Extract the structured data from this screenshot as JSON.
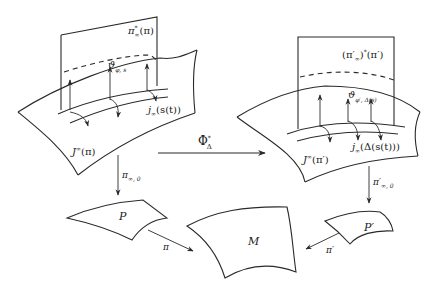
{
  "diagram": {
    "type": "commutative-fiber-bundle-diagram",
    "left_bundle": {
      "surface_label": "J^∞(π)",
      "surface_label_main": "J",
      "surface_label_sup": "∞",
      "surface_label_arg": "(π)",
      "plane_label_main": "π",
      "plane_label_sup": "*",
      "plane_label_sub": "∞",
      "plane_label_arg": "(π)",
      "distribution_label_main": "ϑ",
      "distribution_label_sub": "φ, s",
      "curve_label_main": "j",
      "curve_label_sub": "∞",
      "curve_label_arg": "(s(t))"
    },
    "right_bundle": {
      "surface_label_main": "J",
      "surface_label_sup": "∞",
      "surface_label_arg": "(π′)",
      "plane_label_pre": "(π′",
      "plane_label_sub": "∞",
      "plane_label_post": ")",
      "plane_label_sup": "*",
      "plane_label_arg": "(π′)",
      "distribution_label_main": "ϑ",
      "distribution_label_sub": "φ′, Δ(s)",
      "curve_label_main": "j",
      "curve_label_sub": "∞",
      "curve_label_arg": "(Δ(s(t)))"
    },
    "arrows": {
      "phi_main": "Φ",
      "phi_sup": "*",
      "phi_sub": "Δ",
      "left_proj_main": "π",
      "left_proj_sub": "∞, 0",
      "right_proj_main": "π′",
      "right_proj_sub": "∞, 0",
      "pi_label": "π",
      "pi_prime_label": "π′"
    },
    "bases": {
      "P": "P",
      "P_prime": "P′",
      "M": "M"
    }
  }
}
